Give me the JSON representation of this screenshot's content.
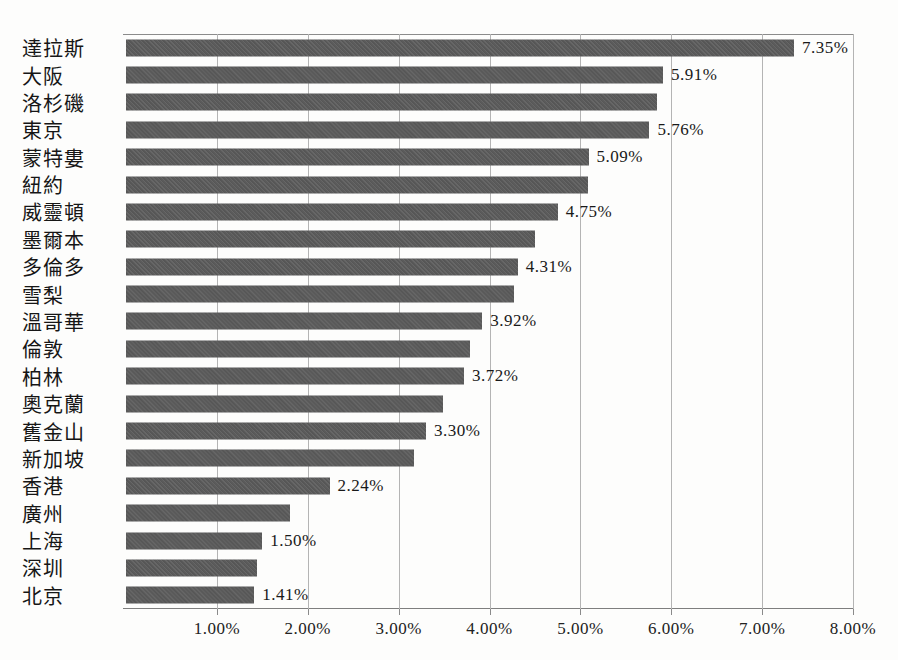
{
  "chart_data": {
    "type": "bar",
    "orientation": "horizontal",
    "title": "",
    "xlabel": "",
    "ylabel": "",
    "grid": "vertical",
    "legend": "none",
    "bar_color": "#5b5b5b",
    "xlim": [
      0,
      8
    ],
    "categories": [
      "達拉斯",
      "大阪",
      "洛杉磯",
      "東京",
      "蒙特婁",
      "紐約",
      "威靈頓",
      "墨爾本",
      "多倫多",
      "雪梨",
      "溫哥華",
      "倫敦",
      "柏林",
      "奧克蘭",
      "舊金山",
      "新加坡",
      "香港",
      "廣州",
      "上海",
      "深圳",
      "北京"
    ],
    "values": [
      7.35,
      5.91,
      5.84,
      5.76,
      5.09,
      5.08,
      4.75,
      4.5,
      4.31,
      4.27,
      3.92,
      3.79,
      3.72,
      3.49,
      3.3,
      3.17,
      2.24,
      1.81,
      1.5,
      1.44,
      1.41
    ],
    "data_labels": [
      "7.35%",
      "5.91%",
      "",
      "5.76%",
      "5.09%",
      "",
      "4.75%",
      "",
      "4.31%",
      "",
      "3.92%",
      "",
      "3.72%",
      "",
      "3.30%",
      "",
      "2.24%",
      "",
      "1.50%",
      "",
      "1.41%"
    ],
    "x_ticks": [
      {
        "value": 1,
        "label": "1.00%"
      },
      {
        "value": 2,
        "label": "2.00%"
      },
      {
        "value": 3,
        "label": "3.00%"
      },
      {
        "value": 4,
        "label": "4.00%"
      },
      {
        "value": 5,
        "label": "5.00%"
      },
      {
        "value": 6,
        "label": "6.00%"
      },
      {
        "value": 7,
        "label": "7.00%"
      },
      {
        "value": 8,
        "label": "8.00%"
      }
    ]
  }
}
